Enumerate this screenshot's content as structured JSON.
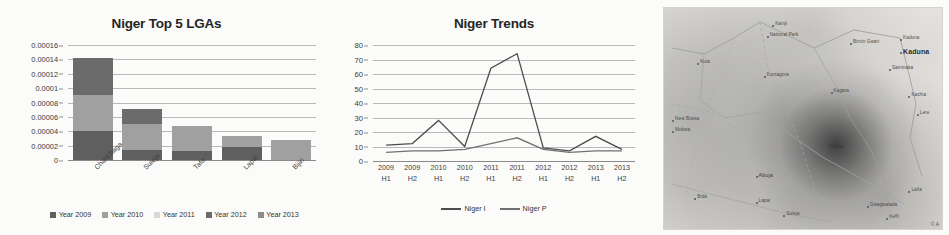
{
  "chart_data": [
    {
      "type": "bar",
      "title": "Niger Top 5 LGAs",
      "xlabel": "",
      "ylabel": "",
      "stacked": true,
      "grid": true,
      "legend_position": "bottom",
      "ylim": [
        0,
        0.00016
      ],
      "ytick_labels": [
        "0.00016",
        "0.00014",
        "0.00012",
        "0.0001",
        "0.00008",
        "0.00006",
        "0.00004",
        "0.00002",
        "0"
      ],
      "ytick_values": [
        0.00016,
        0.00014,
        0.00012,
        0.0001,
        8e-05,
        6e-05,
        4e-05,
        2e-05,
        0
      ],
      "categories": [
        "Chanchaga",
        "Suleja",
        "Tafa",
        "Lapai",
        "Bijiri"
      ],
      "series": [
        {
          "name": "Year 2009",
          "color": "#5f5f5f",
          "values": [
            4e-05,
            1.35e-05,
            1.25e-05,
            1.75e-05,
            0
          ]
        },
        {
          "name": "Year 2010",
          "color": "#a0a0a0",
          "values": [
            5e-05,
            3.65e-05,
            3.55e-05,
            1.65e-05,
            2.8e-05
          ]
        },
        {
          "name": "Year 2011",
          "color": "#d8d8d8",
          "values": [
            0,
            0,
            0,
            0,
            0
          ]
        },
        {
          "name": "Year 2012",
          "color": "#6b6b6b",
          "values": [
            5.25e-05,
            2.1e-05,
            0,
            0,
            0
          ]
        },
        {
          "name": "Year 2013",
          "color": "#8c8c8c",
          "values": [
            0,
            0,
            0,
            0,
            0
          ]
        }
      ],
      "totals": [
        0.0001425,
        7.1e-05,
        4.8e-05,
        3.4e-05,
        2.8e-05
      ]
    },
    {
      "type": "line",
      "title": "Niger Trends",
      "xlabel": "",
      "ylabel": "",
      "grid": true,
      "legend_position": "bottom",
      "ylim": [
        0,
        80
      ],
      "ytick_labels": [
        "80",
        "70",
        "60",
        "50",
        "40",
        "30",
        "20",
        "10",
        "0"
      ],
      "ytick_values": [
        80,
        70,
        60,
        50,
        40,
        30,
        20,
        10,
        0
      ],
      "categories": [
        {
          "year": "2009",
          "half": "H1"
        },
        {
          "year": "2009",
          "half": "H2"
        },
        {
          "year": "2010",
          "half": "H1"
        },
        {
          "year": "2010",
          "half": "H2"
        },
        {
          "year": "2011",
          "half": "H1"
        },
        {
          "year": "2011",
          "half": "H2"
        },
        {
          "year": "2012",
          "half": "H1"
        },
        {
          "year": "2012",
          "half": "H2"
        },
        {
          "year": "2013",
          "half": "H1"
        },
        {
          "year": "2013",
          "half": "H2"
        }
      ],
      "series": [
        {
          "name": "Niger I",
          "color": "#4d4d4d",
          "values": [
            11,
            12,
            28,
            10,
            64,
            74,
            9,
            7,
            17,
            8
          ]
        },
        {
          "name": "Niger P",
          "color": "#707070",
          "values": [
            6,
            7,
            7,
            8,
            12,
            16,
            8,
            6,
            7,
            7
          ]
        }
      ]
    }
  ],
  "map": {
    "name": "niger-state-heatmap",
    "attribution": "© A",
    "labels": [
      {
        "text": "Kaduna",
        "x": 86,
        "y": 18,
        "size": "big"
      },
      {
        "text": "Kaduna",
        "x": 86,
        "y": 12,
        "size": "small"
      },
      {
        "text": "Saminaka",
        "x": 82,
        "y": 26,
        "size": "small"
      },
      {
        "text": "Birnin Gwari",
        "x": 68,
        "y": 14,
        "size": "small"
      },
      {
        "text": "Kachia",
        "x": 89,
        "y": 38,
        "size": "small"
      },
      {
        "text": "Lere",
        "x": 92,
        "y": 46,
        "size": "small"
      },
      {
        "text": "Kainji",
        "x": 40,
        "y": 6,
        "size": "small"
      },
      {
        "text": "National Park",
        "x": 38,
        "y": 11,
        "size": "small"
      },
      {
        "text": "Kontagora",
        "x": 37,
        "y": 29,
        "size": "small"
      },
      {
        "text": "Kagara",
        "x": 61,
        "y": 36,
        "size": "small"
      },
      {
        "text": "Kuta",
        "x": 13,
        "y": 23,
        "size": "small"
      },
      {
        "text": "New Bussa",
        "x": 4,
        "y": 49,
        "size": "small"
      },
      {
        "text": "Mokwa",
        "x": 4,
        "y": 54,
        "size": "small"
      },
      {
        "text": "Minna",
        "x": 59,
        "y": 61,
        "size": "mid"
      },
      {
        "text": "Abuja",
        "x": 34,
        "y": 74,
        "size": "mid"
      },
      {
        "text": "Bida",
        "x": 12,
        "y": 84,
        "size": "small"
      },
      {
        "text": "Lapai",
        "x": 34,
        "y": 86,
        "size": "small"
      },
      {
        "text": "Suleja",
        "x": 44,
        "y": 92,
        "size": "small"
      },
      {
        "text": "Gwagwalada",
        "x": 74,
        "y": 88,
        "size": "small"
      },
      {
        "text": "Keffi",
        "x": 81,
        "y": 93,
        "size": "small"
      },
      {
        "text": "Lafia",
        "x": 89,
        "y": 81,
        "size": "small"
      }
    ]
  }
}
